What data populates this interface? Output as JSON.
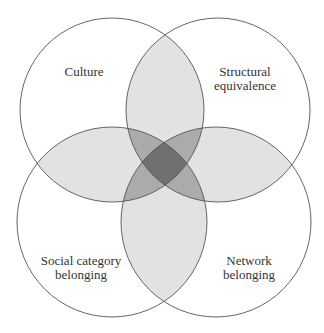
{
  "diagram": {
    "type": "venn",
    "sets": [
      {
        "id": "culture",
        "label_lines": [
          "Culture"
        ]
      },
      {
        "id": "structural",
        "label_lines": [
          "Structural",
          "equivalence"
        ]
      },
      {
        "id": "social",
        "label_lines": [
          "Social category",
          "belonging"
        ]
      },
      {
        "id": "network",
        "label_lines": [
          "Network",
          "belonging"
        ]
      }
    ],
    "colors": {
      "stroke": "#555555",
      "overlap2": "#e0e0e0",
      "overlap3": "#a8a8a8",
      "overlap4": "#6e6e6e"
    }
  }
}
